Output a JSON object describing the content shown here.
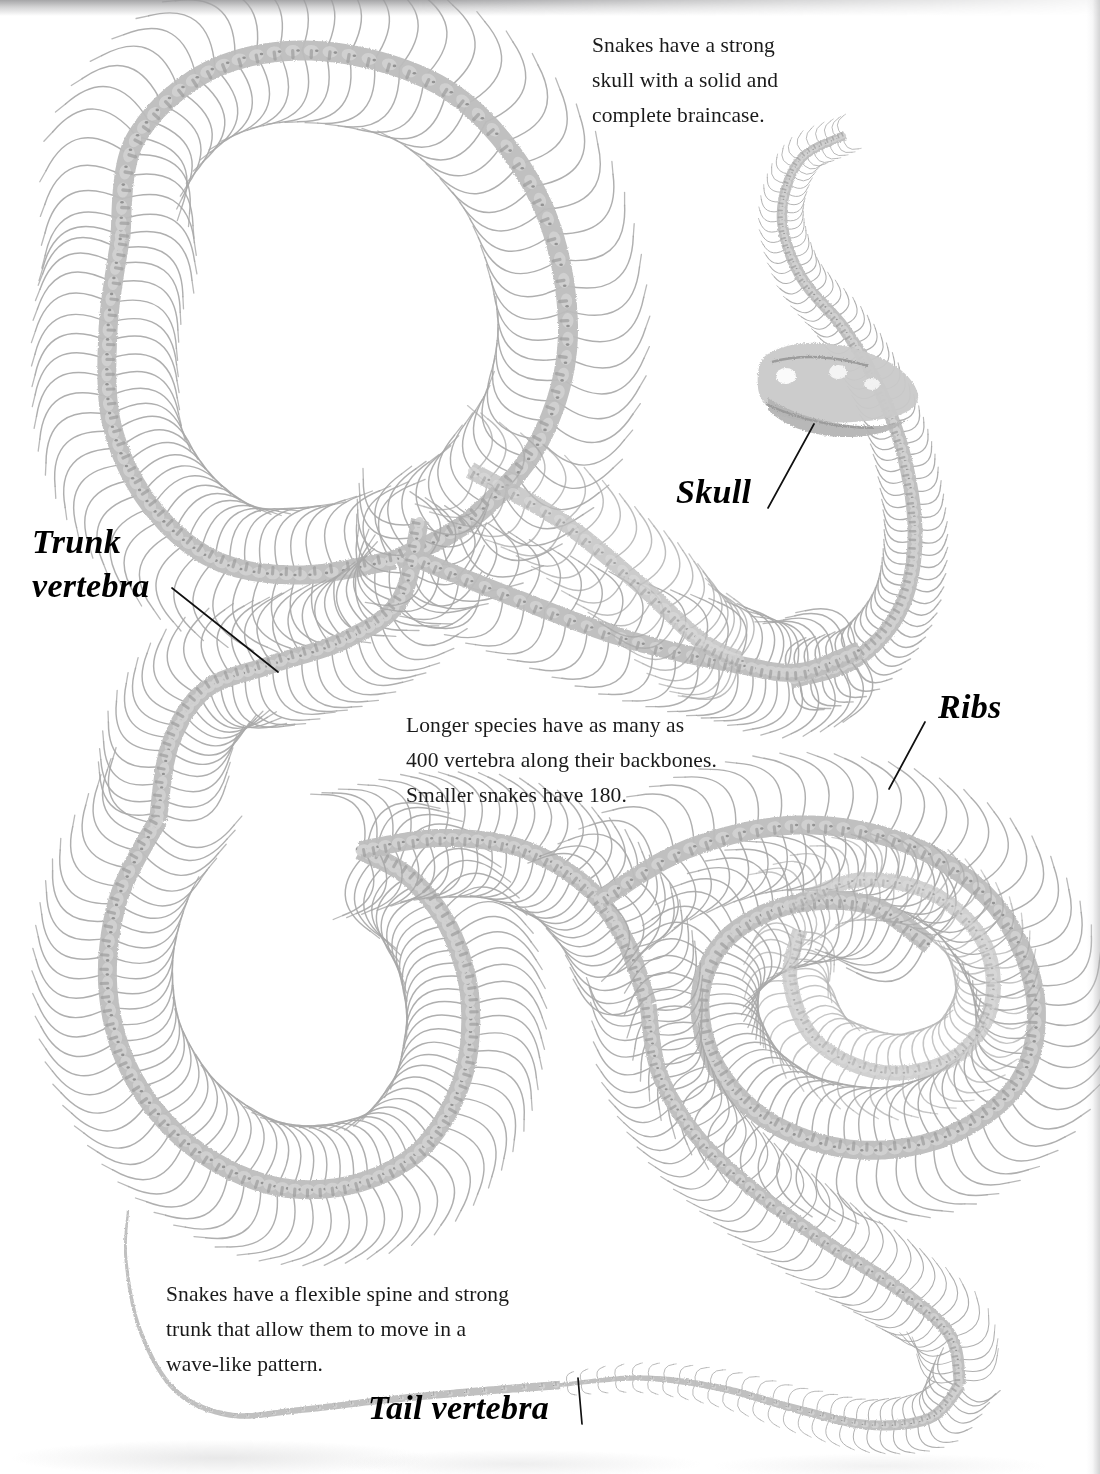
{
  "page": {
    "kind": "book-page-scan",
    "background_color": "#ffffff",
    "bone_color": "#a8a8a8",
    "bone_dark_color": "#6e6e6e",
    "text_color": "#1a1a1a",
    "label_color": "#000000"
  },
  "captions": [
    {
      "id": "skull-caption",
      "text": "Snakes have a strong\nskull with a solid and\ncomplete braincase."
    },
    {
      "id": "vertebra-count-caption",
      "text": "Longer species have as many as\n400 vertebra along their backbones.\nSmaller snakes have 180."
    },
    {
      "id": "flexible-spine-caption",
      "text": "Snakes have a flexible spine and strong\ntrunk that allow them to move in a\nwave-like pattern."
    }
  ],
  "part_labels": [
    {
      "id": "trunk-vertebra",
      "text": "Trunk\nvertebra"
    },
    {
      "id": "skull",
      "text": "Skull"
    },
    {
      "id": "ribs",
      "text": "Ribs"
    },
    {
      "id": "tail-vertebra",
      "text": "Tail vertebra"
    }
  ],
  "leader_lines": [
    {
      "id": "trunk-vertebra-leader",
      "x1": 172,
      "y1": 588,
      "x2": 278,
      "y2": 672
    },
    {
      "id": "skull-leader",
      "x1": 768,
      "y1": 508,
      "x2": 814,
      "y2": 424
    },
    {
      "id": "ribs-leader",
      "x1": 925,
      "y1": 722,
      "x2": 889,
      "y2": 789
    },
    {
      "id": "tail-vertebra-leader",
      "x1": 582,
      "y1": 1424,
      "x2": 578,
      "y2": 1378
    }
  ],
  "facts": {
    "max_vertebra_long_species": 400,
    "vertebra_small_snakes": 180
  }
}
